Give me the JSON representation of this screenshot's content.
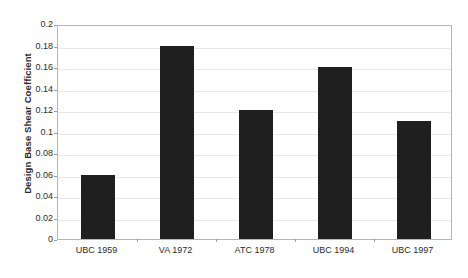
{
  "chart_data": {
    "type": "bar",
    "title": "",
    "subtitle": "",
    "xlabel": "",
    "ylabel": "Design Base Shear Coefficient",
    "categories": [
      "UBC 1959",
      "VA 1972",
      "ATC 1978",
      "UBC 1994",
      "UBC 1997"
    ],
    "values": [
      0.06,
      0.18,
      0.12,
      0.16,
      0.11
    ],
    "series": [
      {
        "name": "Design Base Shear Coefficient",
        "values": [
          0.06,
          0.18,
          0.12,
          0.16,
          0.11
        ]
      }
    ],
    "ylim": [
      0,
      0.2
    ],
    "ytick_values": [
      0,
      0.02,
      0.04,
      0.06,
      0.08,
      0.1,
      0.12,
      0.14,
      0.16,
      0.18,
      0.2
    ],
    "ytick_labels": [
      "0",
      "0.02",
      "0.04",
      "0.06",
      "0.08",
      "0.1",
      "0.12",
      "0.14",
      "0.16",
      "0.18",
      "0.2"
    ],
    "grid": true,
    "grid_axis": "y",
    "legend": false,
    "legend_position": "none",
    "bar_color": "#1f1f1f",
    "gridline_color": "#e8e8e8",
    "axis_color": "#b5b5b5",
    "background_color": "#ffffff",
    "text_color": "#2b2b2b",
    "annotations": []
  }
}
